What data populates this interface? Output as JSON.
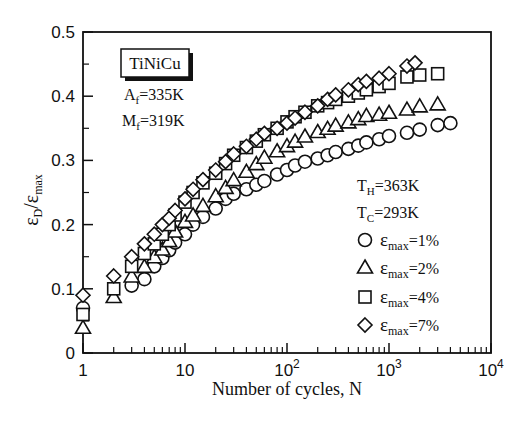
{
  "chart_data": {
    "type": "scatter",
    "title": "",
    "xlabel": "Number of cycles, N",
    "ylabel": "εD/εmax",
    "ylabel_parts": {
      "main": "ε",
      "sub1": "D",
      "sep": "/",
      "main2": "ε",
      "sub2": "max"
    },
    "xscale": "log",
    "xlim": [
      1,
      10000
    ],
    "ylim": [
      0,
      0.5
    ],
    "xticks": [
      {
        "value": 1,
        "label": "1",
        "sup": ""
      },
      {
        "value": 10,
        "label": "10",
        "sup": ""
      },
      {
        "value": 100,
        "label": "10",
        "sup": "2"
      },
      {
        "value": 1000,
        "label": "10",
        "sup": "3"
      },
      {
        "value": 10000,
        "label": "10",
        "sup": "4"
      }
    ],
    "yticks": [
      {
        "value": 0,
        "label": "0"
      },
      {
        "value": 0.1,
        "label": "0.1"
      },
      {
        "value": 0.2,
        "label": "0.2"
      },
      {
        "value": 0.3,
        "label": "0.3"
      },
      {
        "value": 0.4,
        "label": "0.4"
      },
      {
        "value": 0.5,
        "label": "0.5"
      }
    ],
    "grid": false,
    "annotations": {
      "material_box": "TiNiCu",
      "af": {
        "main": "A",
        "sub": "f",
        "value": "=335K"
      },
      "mf": {
        "main": "M",
        "sub": "f",
        "value": "=319K"
      },
      "th": {
        "main": "T",
        "sub": "H",
        "value": "=363K"
      },
      "tc": {
        "main": "T",
        "sub": "C",
        "value": "=293K"
      }
    },
    "legend_position": "lower right (inside plot)",
    "series": [
      {
        "name": "εmax=1%",
        "label_main": "ε",
        "label_sub": "max",
        "label_value": "=1%",
        "marker": "circle",
        "x": [
          1,
          3,
          4,
          5,
          6,
          7,
          8,
          10,
          12,
          15,
          20,
          25,
          30,
          40,
          50,
          60,
          80,
          100,
          120,
          150,
          200,
          250,
          300,
          400,
          500,
          600,
          800,
          1000,
          1500,
          2000,
          3000,
          4000
        ],
        "y": [
          0.07,
          0.105,
          0.115,
          0.135,
          0.148,
          0.16,
          0.172,
          0.185,
          0.2,
          0.212,
          0.225,
          0.24,
          0.248,
          0.255,
          0.262,
          0.268,
          0.278,
          0.285,
          0.292,
          0.298,
          0.303,
          0.308,
          0.313,
          0.318,
          0.323,
          0.328,
          0.333,
          0.338,
          0.343,
          0.348,
          0.355,
          0.358
        ]
      },
      {
        "name": "εmax=2%",
        "label_main": "ε",
        "label_sub": "max",
        "label_value": "=2%",
        "marker": "triangle",
        "x": [
          1,
          2,
          3,
          4,
          5,
          6,
          7,
          8,
          10,
          12,
          15,
          20,
          25,
          30,
          40,
          50,
          60,
          80,
          100,
          120,
          150,
          200,
          250,
          300,
          400,
          500,
          600,
          800,
          1000,
          1500,
          2000,
          3000
        ],
        "y": [
          0.04,
          0.088,
          0.12,
          0.135,
          0.15,
          0.162,
          0.175,
          0.19,
          0.205,
          0.215,
          0.23,
          0.245,
          0.258,
          0.27,
          0.283,
          0.295,
          0.305,
          0.315,
          0.323,
          0.33,
          0.338,
          0.345,
          0.35,
          0.355,
          0.36,
          0.365,
          0.37,
          0.372,
          0.375,
          0.38,
          0.385,
          0.388
        ]
      },
      {
        "name": "εmax=4%",
        "label_main": "ε",
        "label_sub": "max",
        "label_value": "=4%",
        "marker": "square",
        "x": [
          1,
          2,
          3,
          4,
          5,
          6,
          7,
          8,
          10,
          12,
          15,
          20,
          25,
          30,
          40,
          50,
          60,
          80,
          100,
          120,
          150,
          200,
          250,
          300,
          400,
          500,
          600,
          800,
          1000,
          1500,
          2000,
          3000
        ],
        "y": [
          0.06,
          0.1,
          0.135,
          0.155,
          0.17,
          0.185,
          0.2,
          0.215,
          0.235,
          0.25,
          0.265,
          0.28,
          0.295,
          0.308,
          0.32,
          0.33,
          0.34,
          0.35,
          0.36,
          0.368,
          0.375,
          0.385,
          0.39,
          0.395,
          0.4,
          0.405,
          0.41,
          0.415,
          0.42,
          0.43,
          0.433,
          0.435
        ]
      },
      {
        "name": "εmax=7%",
        "label_main": "ε",
        "label_sub": "max",
        "label_value": "=7%",
        "marker": "diamond",
        "x": [
          1,
          2,
          3,
          4,
          5,
          6,
          7,
          8,
          10,
          12,
          15,
          20,
          25,
          30,
          40,
          50,
          60,
          80,
          100,
          120,
          150,
          200,
          250,
          300,
          400,
          500,
          600,
          800,
          1000,
          1500,
          1800
        ],
        "y": [
          0.09,
          0.12,
          0.15,
          0.17,
          0.185,
          0.2,
          0.21,
          0.222,
          0.24,
          0.255,
          0.27,
          0.285,
          0.298,
          0.31,
          0.322,
          0.333,
          0.342,
          0.35,
          0.358,
          0.366,
          0.375,
          0.385,
          0.395,
          0.402,
          0.41,
          0.418,
          0.423,
          0.428,
          0.435,
          0.447,
          0.452
        ]
      }
    ]
  }
}
